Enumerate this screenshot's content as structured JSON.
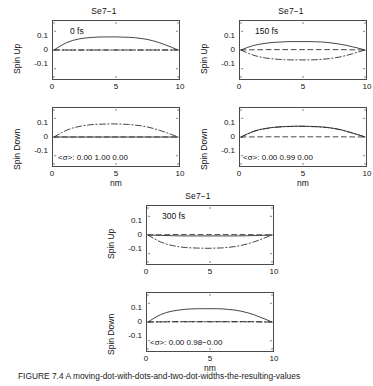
{
  "figure": {
    "caption": "FIGURE 7.4   A moving-dot-with-dots-and-two-dot-widths-the-resulting-values"
  },
  "axes": {
    "x_ticks": [
      "0",
      "5",
      "10"
    ],
    "y_ticks": [
      "0.1",
      "0",
      "-0.1"
    ],
    "xlabel": "nm",
    "ylabel_up": "Spin Up",
    "ylabel_down": "Spin Down",
    "xlim": [
      0,
      10
    ],
    "ylim": [
      -0.15,
      0.15
    ],
    "sigma_label": "<σ>:"
  },
  "groups": [
    {
      "id": "group-0fs",
      "title": "Se7−1",
      "time": "0 fs",
      "sigma_values": [
        "0.00",
        "1.00",
        "0.00"
      ],
      "sigma_text": "<σ>:   0.00  1.00   0.00"
    },
    {
      "id": "group-150fs",
      "title": "Se7−1",
      "time": "150 fs",
      "sigma_values": [
        "0.00",
        "0.99",
        "0.00"
      ],
      "sigma_text": "<σ>:   0.00  0.99   0.00"
    },
    {
      "id": "group-300fs",
      "title": "Se7−1",
      "time": "300 fs",
      "sigma_values": [
        "0.00",
        "0.98−0.00"
      ],
      "sigma_text": "<σ>:   0.00  0.98−0.00"
    }
  ],
  "chart_data": {
    "type": "line",
    "title": "Se7−1",
    "xlabel": "nm",
    "ylabel": [
      "Spin Up",
      "Spin Down"
    ],
    "xlim": [
      0,
      10
    ],
    "ylim": [
      -0.15,
      0.15
    ],
    "x_ticks": [
      0,
      5,
      10
    ],
    "y_ticks": [
      -0.1,
      0,
      0.1
    ],
    "grid": false,
    "legend": "none",
    "line_styles": [
      "solid",
      "dashed",
      "dashdot"
    ],
    "panels": [
      {
        "panel": "0fs-spin-up",
        "time_fs": 0,
        "spin": "up",
        "series": [
          {
            "name": "solid",
            "style": "solid",
            "x": [
              0,
              0.5,
              1,
              1.5,
              2,
              2.5,
              3,
              3.5,
              4,
              4.5,
              5,
              5.5,
              6,
              6.5,
              7,
              7.5,
              8,
              8.5,
              9,
              9.5,
              10
            ],
            "values": [
              0.0,
              0.021,
              0.039,
              0.051,
              0.059,
              0.064,
              0.067,
              0.069,
              0.07,
              0.07,
              0.07,
              0.069,
              0.068,
              0.066,
              0.062,
              0.057,
              0.049,
              0.039,
              0.027,
              0.014,
              0.0
            ]
          },
          {
            "name": "dashed",
            "style": "dashed",
            "x": [
              0,
              2,
              4,
              6,
              8,
              10
            ],
            "values": [
              0,
              0,
              0,
              0,
              0,
              0
            ]
          },
          {
            "name": "dashdot",
            "style": "dashdot",
            "x": [
              0,
              2,
              4,
              6,
              8,
              10
            ],
            "values": [
              0,
              0,
              0,
              0,
              0,
              0
            ]
          }
        ]
      },
      {
        "panel": "0fs-spin-down",
        "time_fs": 0,
        "spin": "down",
        "series": [
          {
            "name": "solid",
            "style": "solid",
            "x": [
              0,
              2,
              4,
              6,
              8,
              10
            ],
            "values": [
              0,
              0,
              0,
              0,
              0,
              0
            ]
          },
          {
            "name": "dashed",
            "style": "dashed",
            "x": [
              0,
              2,
              4,
              6,
              8,
              10
            ],
            "values": [
              0,
              0,
              0,
              0,
              0,
              0
            ]
          },
          {
            "name": "dashdot",
            "style": "dashdot",
            "x": [
              0,
              0.5,
              1,
              1.5,
              2,
              2.5,
              3,
              3.5,
              4,
              4.5,
              5,
              5.5,
              6,
              6.5,
              7,
              7.5,
              8,
              8.5,
              9,
              9.5,
              10
            ],
            "values": [
              0.0,
              0.019,
              0.036,
              0.048,
              0.056,
              0.062,
              0.066,
              0.068,
              0.069,
              0.07,
              0.07,
              0.069,
              0.067,
              0.064,
              0.06,
              0.054,
              0.046,
              0.036,
              0.025,
              0.013,
              0.0
            ]
          }
        ]
      },
      {
        "panel": "150fs-spin-up",
        "time_fs": 150,
        "spin": "up",
        "series": [
          {
            "name": "solid",
            "style": "solid",
            "x": [
              0,
              0.5,
              1,
              1.5,
              2,
              2.5,
              3,
              3.5,
              4,
              4.5,
              5,
              5.5,
              6,
              6.5,
              7,
              7.5,
              8,
              8.5,
              9,
              9.5,
              10
            ],
            "values": [
              0.0,
              0.013,
              0.024,
              0.031,
              0.036,
              0.04,
              0.042,
              0.044,
              0.045,
              0.045,
              0.045,
              0.045,
              0.044,
              0.043,
              0.04,
              0.036,
              0.031,
              0.025,
              0.017,
              0.009,
              0.0
            ]
          },
          {
            "name": "dashed",
            "style": "dashed",
            "x": [
              0,
              2,
              4,
              6,
              8,
              10
            ],
            "values": [
              0,
              0.002,
              0.002,
              0.002,
              0.002,
              0
            ]
          },
          {
            "name": "dashdot",
            "style": "dashdot",
            "x": [
              0,
              0.5,
              1,
              1.5,
              2,
              2.5,
              3,
              3.5,
              4,
              4.5,
              5,
              5.5,
              6,
              6.5,
              7,
              7.5,
              8,
              8.5,
              9,
              9.5,
              10
            ],
            "values": [
              0.0,
              -0.015,
              -0.028,
              -0.037,
              -0.043,
              -0.047,
              -0.05,
              -0.052,
              -0.053,
              -0.053,
              -0.053,
              -0.053,
              -0.052,
              -0.05,
              -0.047,
              -0.043,
              -0.037,
              -0.029,
              -0.02,
              -0.01,
              0.0
            ]
          }
        ]
      },
      {
        "panel": "150fs-spin-down",
        "time_fs": 150,
        "spin": "down",
        "series": [
          {
            "name": "solid",
            "style": "solid",
            "x": [
              0,
              0.5,
              1,
              1.5,
              2,
              2.5,
              3,
              3.5,
              4,
              4.5,
              5,
              5.5,
              6,
              6.5,
              7,
              7.5,
              8,
              8.5,
              9,
              9.5,
              10
            ],
            "values": [
              0.0,
              0.016,
              0.03,
              0.04,
              0.046,
              0.051,
              0.054,
              0.056,
              0.057,
              0.058,
              0.058,
              0.057,
              0.056,
              0.054,
              0.051,
              0.046,
              0.04,
              0.031,
              0.021,
              0.011,
              0.0
            ]
          },
          {
            "name": "dashed",
            "style": "dashed",
            "x": [
              0,
              2,
              4,
              6,
              8,
              10
            ],
            "values": [
              0,
              0.001,
              0.001,
              0.001,
              0.001,
              0
            ]
          },
          {
            "name": "dashdot",
            "style": "dashdot",
            "x": [
              0,
              0.5,
              1,
              1.5,
              2,
              2.5,
              3,
              3.5,
              4,
              4.5,
              5,
              5.5,
              6,
              6.5,
              7,
              7.5,
              8,
              8.5,
              9,
              9.5,
              10
            ],
            "values": [
              0.0,
              0.015,
              0.029,
              0.039,
              0.045,
              0.05,
              0.053,
              0.055,
              0.056,
              0.057,
              0.057,
              0.056,
              0.055,
              0.053,
              0.05,
              0.045,
              0.039,
              0.03,
              0.021,
              0.011,
              0.0
            ]
          }
        ]
      },
      {
        "panel": "300fs-spin-up",
        "time_fs": 300,
        "spin": "up",
        "series": [
          {
            "name": "solid",
            "style": "solid",
            "x": [
              0,
              1,
              2,
              3,
              4,
              5,
              6,
              7,
              8,
              9,
              10
            ],
            "values": [
              0.0,
              -0.002,
              -0.004,
              -0.005,
              -0.005,
              -0.005,
              -0.005,
              -0.005,
              -0.004,
              -0.002,
              0.0
            ]
          },
          {
            "name": "dashed",
            "style": "dashed",
            "x": [
              0,
              2,
              4,
              6,
              8,
              10
            ],
            "values": [
              0,
              0.002,
              0.002,
              0.002,
              0.002,
              0
            ]
          },
          {
            "name": "dashdot",
            "style": "dashdot",
            "x": [
              0,
              0.5,
              1,
              1.5,
              2,
              2.5,
              3,
              3.5,
              4,
              4.5,
              5,
              5.5,
              6,
              6.5,
              7,
              7.5,
              8,
              8.5,
              9,
              9.5,
              10
            ],
            "values": [
              0.0,
              -0.02,
              -0.037,
              -0.049,
              -0.057,
              -0.063,
              -0.067,
              -0.069,
              -0.07,
              -0.071,
              -0.071,
              -0.07,
              -0.069,
              -0.066,
              -0.062,
              -0.056,
              -0.048,
              -0.038,
              -0.026,
              -0.013,
              0.0
            ]
          }
        ]
      },
      {
        "panel": "300fs-spin-down",
        "time_fs": 300,
        "spin": "down",
        "series": [
          {
            "name": "solid",
            "style": "solid",
            "x": [
              0,
              0.5,
              1,
              1.5,
              2,
              2.5,
              3,
              3.5,
              4,
              4.5,
              5,
              5.5,
              6,
              6.5,
              7,
              7.5,
              8,
              8.5,
              9,
              9.5,
              10
            ],
            "values": [
              0.0,
              0.021,
              0.039,
              0.051,
              0.059,
              0.064,
              0.068,
              0.07,
              0.071,
              0.071,
              0.071,
              0.071,
              0.07,
              0.067,
              0.064,
              0.058,
              0.05,
              0.04,
              0.027,
              0.014,
              0.0
            ]
          },
          {
            "name": "dashed",
            "style": "dashed",
            "x": [
              0,
              2,
              4,
              6,
              8,
              10
            ],
            "values": [
              0,
              0.002,
              0.002,
              0.002,
              0.002,
              0
            ]
          },
          {
            "name": "dashdot",
            "style": "dashdot",
            "x": [
              0,
              2,
              4,
              6,
              8,
              10
            ],
            "values": [
              0,
              0.001,
              0.001,
              0.001,
              0.001,
              0
            ]
          }
        ]
      }
    ]
  }
}
